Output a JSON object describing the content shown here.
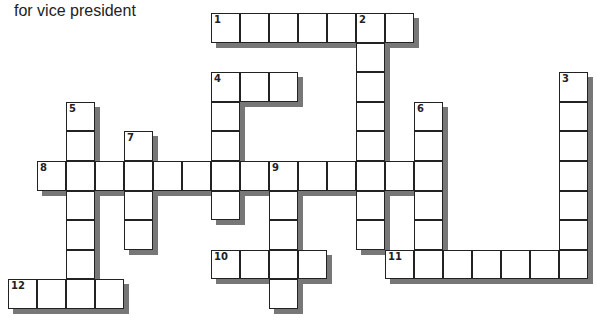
{
  "header": {
    "text": "for vice president"
  },
  "grid": {
    "origin_x": 8,
    "origin_y": 13,
    "cell_w": 29,
    "cell_h": 29.6,
    "words": [
      {
        "number": "1",
        "direction": "across",
        "row": 0,
        "col": 7,
        "length": 7
      },
      {
        "number": "2",
        "direction": "down",
        "row": 0,
        "col": 12,
        "length": 8
      },
      {
        "number": "3",
        "direction": "down",
        "row": 2,
        "col": 19,
        "length": 7
      },
      {
        "number": "4",
        "direction": "across",
        "row": 2,
        "col": 7,
        "length": 3
      },
      {
        "number": "4",
        "direction": "down",
        "row": 2,
        "col": 7,
        "length": 5
      },
      {
        "number": "5",
        "direction": "down",
        "row": 3,
        "col": 2,
        "length": 6
      },
      {
        "number": "6",
        "direction": "down",
        "row": 3,
        "col": 14,
        "length": 6
      },
      {
        "number": "7",
        "direction": "down",
        "row": 4,
        "col": 4,
        "length": 4
      },
      {
        "number": "8",
        "direction": "across",
        "row": 5,
        "col": 1,
        "length": 14
      },
      {
        "number": "9",
        "direction": "down",
        "row": 5,
        "col": 9,
        "length": 5
      },
      {
        "number": "10",
        "direction": "across",
        "row": 8,
        "col": 7,
        "length": 4
      },
      {
        "number": "11",
        "direction": "across",
        "row": 8,
        "col": 13,
        "length": 7
      },
      {
        "number": "12",
        "direction": "across",
        "row": 9,
        "col": 0,
        "length": 4
      }
    ]
  }
}
